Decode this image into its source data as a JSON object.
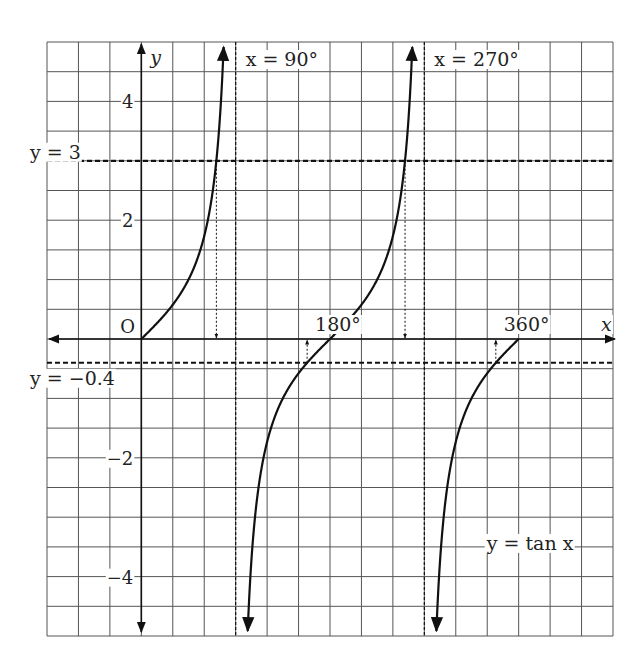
{
  "chart_data": {
    "type": "line",
    "title": "",
    "function_label": "y = tan x",
    "xlabel": "x",
    "ylabel": "y",
    "origin_label": "O",
    "x_unit": "degrees",
    "xlim": [
      -90,
      450
    ],
    "ylim": [
      -5,
      5
    ],
    "grid": true,
    "grid_step_x_deg": 30,
    "grid_step_y": 0.5,
    "x_tick_labels": [
      {
        "value": 180,
        "label": "180°"
      },
      {
        "value": 360,
        "label": "360°"
      }
    ],
    "y_tick_labels": [
      {
        "value": 4,
        "label": "4"
      },
      {
        "value": 2,
        "label": "2"
      },
      {
        "value": -2,
        "label": "−2"
      },
      {
        "value": -4,
        "label": "−4"
      }
    ],
    "asymptotes": [
      {
        "x": 90,
        "label": "x = 90°"
      },
      {
        "x": 270,
        "label": "x = 270°"
      }
    ],
    "horizontal_lines": [
      {
        "y": 3,
        "label": "y = 3"
      },
      {
        "y": -0.4,
        "label": "y = −0.4"
      }
    ],
    "series": [
      {
        "name": "tan x branch 1",
        "x_range": [
          0,
          89
        ],
        "y_end_marker": "arrow-up"
      },
      {
        "name": "tan x branch 2",
        "x_range": [
          91,
          269
        ],
        "start_marker": "arrow-down",
        "end_marker": "arrow-up"
      },
      {
        "name": "tan x branch 3",
        "x_range": [
          271,
          360
        ],
        "start_marker": "arrow-down"
      }
    ],
    "solution_markers": [
      {
        "x_deg": 71.6,
        "from_y": 3,
        "direction": "down"
      },
      {
        "x_deg": 251.6,
        "from_y": 3,
        "direction": "down"
      },
      {
        "x_deg": 158.2,
        "from_y": -0.4,
        "direction": "up"
      },
      {
        "x_deg": 338.2,
        "from_y": -0.4,
        "direction": "up"
      }
    ]
  }
}
